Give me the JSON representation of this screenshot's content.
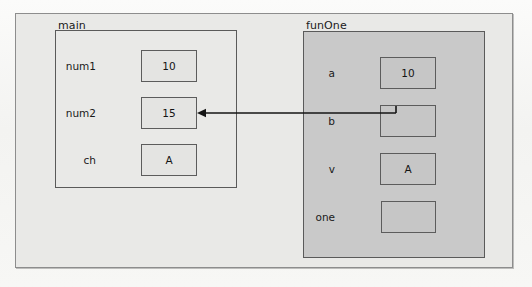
{
  "diagram": {
    "outer_frame": {
      "x": 15,
      "y": 13,
      "w": 498,
      "h": 255
    },
    "colors": {
      "page_background": "#f6f6f4",
      "outer_fill": "#e9e9e7",
      "main_scope_fill": "#e9e9e7",
      "funone_scope_fill": "#c9c9c9",
      "box_border": "#5a5a5a",
      "frame_border": "#8d8d8d",
      "text": "#1a1a1a",
      "arrow": "#141414"
    },
    "scopes": [
      {
        "name": "main",
        "label": "main",
        "fill_tone": "light",
        "box": {
          "x": 55,
          "y": 30,
          "w": 182,
          "h": 158
        },
        "label_pos": {
          "x": 58,
          "y": 20
        },
        "variables": [
          {
            "name": "num1",
            "label": "num1",
            "value": "10",
            "cell": {
              "x": 141,
              "y": 50,
              "w": 56,
              "h": 32
            },
            "label_pos": {
              "x": 96,
              "y": 60
            }
          },
          {
            "name": "num2",
            "label": "num2",
            "value": "15",
            "cell": {
              "x": 141,
              "y": 97,
              "w": 56,
              "h": 32
            },
            "label_pos": {
              "x": 96,
              "y": 107
            }
          },
          {
            "name": "ch",
            "label": "ch",
            "value": "A",
            "cell": {
              "x": 141,
              "y": 144,
              "w": 56,
              "h": 32
            },
            "label_pos": {
              "x": 96,
              "y": 154
            }
          }
        ]
      },
      {
        "name": "funOne",
        "label": "funOne",
        "fill_tone": "dark",
        "box": {
          "x": 303,
          "y": 31,
          "w": 182,
          "h": 227
        },
        "label_pos": {
          "x": 306,
          "y": 20
        },
        "variables": [
          {
            "name": "a",
            "label": "a",
            "value": "10",
            "cell": {
              "x": 380,
              "y": 57,
              "w": 56,
              "h": 32
            },
            "label_pos": {
              "x": 335,
              "y": 67
            }
          },
          {
            "name": "b",
            "label": "b",
            "value": "",
            "cell": {
              "x": 380,
              "y": 105,
              "w": 56,
              "h": 32
            },
            "label_pos": {
              "x": 335,
              "y": 115
            }
          },
          {
            "name": "v",
            "label": "v",
            "value": "A",
            "cell": {
              "x": 380,
              "y": 153,
              "w": 56,
              "h": 32
            },
            "label_pos": {
              "x": 335,
              "y": 163
            }
          },
          {
            "name": "one",
            "label": "one",
            "value": "",
            "cell": {
              "x": 381,
              "y": 201,
              "w": 55,
              "h": 32
            },
            "label_pos": {
              "x": 335,
              "y": 211
            }
          }
        ]
      }
    ],
    "arrows": [
      {
        "name": "b-to-num2",
        "from": {
          "x": 396,
          "y": 113
        },
        "to": {
          "x": 197,
          "y": 113
        },
        "head": "end",
        "stub": {
          "x": 396,
          "y": 106
        }
      }
    ]
  }
}
